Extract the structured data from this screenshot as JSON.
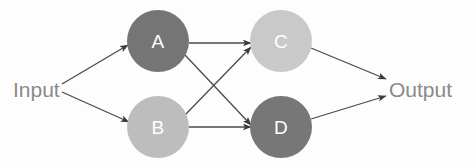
{
  "diagram": {
    "background_color": "#fdfdfd",
    "edge_color": "#4a4a4a",
    "io_label_color": "#8a8a8a",
    "node_label_color": "#ffffff",
    "input": {
      "label": "Input",
      "x": 13,
      "y": 89
    },
    "output": {
      "label": "Output",
      "x": 389,
      "y": 89
    },
    "nodes": [
      {
        "id": "A",
        "label": "A",
        "cx": 158,
        "cy": 41,
        "r": 31,
        "color": "#757575"
      },
      {
        "id": "B",
        "label": "B",
        "cx": 158,
        "cy": 127,
        "r": 31,
        "color": "#bdbdbd"
      },
      {
        "id": "C",
        "label": "C",
        "cx": 281,
        "cy": 41,
        "r": 31,
        "color": "#c9c9c9"
      },
      {
        "id": "D",
        "label": "D",
        "cx": 281,
        "cy": 127,
        "r": 31,
        "color": "#777777"
      }
    ],
    "edges": [
      {
        "from": "Input",
        "to": "A",
        "x1": 62,
        "y1": 84,
        "x2": 128,
        "y2": 45
      },
      {
        "from": "Input",
        "to": "B",
        "x1": 62,
        "y1": 92,
        "x2": 129,
        "y2": 122
      },
      {
        "from": "A",
        "to": "C",
        "x1": 189,
        "y1": 43,
        "x2": 251,
        "y2": 43
      },
      {
        "from": "A",
        "to": "D",
        "x1": 185,
        "y1": 55,
        "x2": 251,
        "y2": 125
      },
      {
        "from": "B",
        "to": "C",
        "x1": 185,
        "y1": 115,
        "x2": 251,
        "y2": 47
      },
      {
        "from": "B",
        "to": "D",
        "x1": 189,
        "y1": 127,
        "x2": 251,
        "y2": 127
      },
      {
        "from": "C",
        "to": "Output",
        "x1": 311,
        "y1": 48,
        "x2": 386,
        "y2": 79
      },
      {
        "from": "D",
        "to": "Output",
        "x1": 311,
        "y1": 119,
        "x2": 386,
        "y2": 96
      }
    ]
  }
}
